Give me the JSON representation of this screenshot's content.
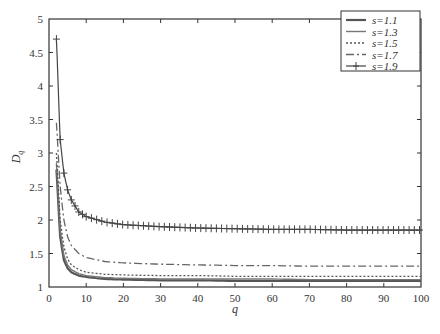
{
  "chart_data": {
    "type": "line",
    "title": "",
    "xlabel": "q",
    "ylabel": "D_q",
    "xlim": [
      0,
      100
    ],
    "ylim": [
      1,
      5
    ],
    "xticks": [
      0,
      10,
      20,
      30,
      40,
      50,
      60,
      70,
      80,
      90,
      100
    ],
    "yticks": [
      1,
      1.5,
      2,
      2.5,
      3,
      3.5,
      4,
      4.5,
      5
    ],
    "ytick_labels": [
      "1",
      "1.5",
      "2",
      "2.5",
      "3",
      "3.5",
      "4",
      "4.5",
      "5"
    ],
    "grid": false,
    "legend_position": "upper right",
    "x": [
      2,
      3,
      4,
      5,
      6,
      8,
      10,
      15,
      20,
      30,
      40,
      50,
      60,
      70,
      80,
      90,
      100
    ],
    "series": [
      {
        "name": "s=1.1",
        "style": "solid-thick",
        "values": [
          2.75,
          1.75,
          1.4,
          1.28,
          1.22,
          1.17,
          1.15,
          1.12,
          1.11,
          1.1,
          1.1,
          1.09,
          1.09,
          1.09,
          1.09,
          1.09,
          1.09
        ]
      },
      {
        "name": "s=1.3",
        "style": "solid",
        "values": [
          2.85,
          1.85,
          1.47,
          1.33,
          1.26,
          1.2,
          1.17,
          1.14,
          1.13,
          1.12,
          1.12,
          1.12,
          1.12,
          1.11,
          1.11,
          1.11,
          1.11
        ]
      },
      {
        "name": "s=1.5",
        "style": "dotted",
        "values": [
          3.0,
          2.0,
          1.6,
          1.42,
          1.33,
          1.26,
          1.22,
          1.19,
          1.18,
          1.17,
          1.17,
          1.16,
          1.16,
          1.16,
          1.16,
          1.16,
          1.16
        ]
      },
      {
        "name": "s=1.7",
        "style": "dash-dot",
        "values": [
          3.45,
          2.5,
          2.0,
          1.75,
          1.62,
          1.5,
          1.44,
          1.38,
          1.36,
          1.34,
          1.33,
          1.32,
          1.32,
          1.31,
          1.31,
          1.31,
          1.31
        ]
      },
      {
        "name": "s=1.9",
        "style": "solid-plus-markers",
        "values": [
          4.7,
          3.2,
          2.7,
          2.45,
          2.3,
          2.12,
          2.05,
          1.97,
          1.93,
          1.9,
          1.88,
          1.87,
          1.86,
          1.86,
          1.85,
          1.85,
          1.85
        ]
      }
    ]
  },
  "legend": {
    "items": [
      {
        "label": "s=1.1"
      },
      {
        "label": "s=1.3"
      },
      {
        "label": "s=1.5"
      },
      {
        "label": "s=1.7"
      },
      {
        "label": "s=1.9"
      }
    ]
  },
  "axes": {
    "xlabel": "q",
    "ylabel": "D",
    "ylabel_sub": "q"
  }
}
